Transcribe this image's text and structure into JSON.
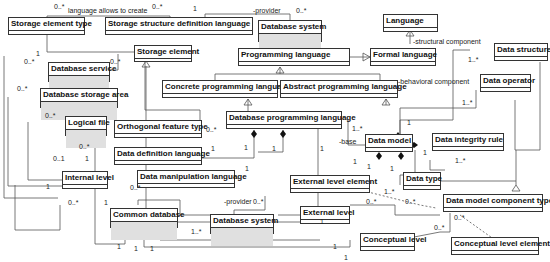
{
  "classes": {
    "storage_element_type": "Storage element type",
    "storage_structure_definition_language": "Storage structure definition language",
    "database_system_top": "Database system",
    "language": "Language",
    "storage_element": "Storage element",
    "programming_language": "Programming language",
    "formal_language": "Formal language",
    "data_structure": "Data structure",
    "database_service": "Database service",
    "database_storage_area": "Database storage area",
    "concrete_programming_language": "Concrete programming language",
    "abstract_programming_language": "Abstract programming language",
    "data_operator": "Data operator",
    "logical_file": "Logical file",
    "orthogonal_feature_type": "Orthogonal feature type",
    "database_programming_language": "Database programming language",
    "data_definition_language": "Data definition language",
    "data_model": "Data model",
    "data_integrity_rule": "Data integrity rule",
    "internal_level": "Internal level",
    "data_manipulation_language": "Data manipulation language",
    "external_level_element": "External level element",
    "data_type": "Data type",
    "common_database": "Common database",
    "database_system_bottom": "Database system",
    "external_level": "External level",
    "data_model_component_type": "Data model component type",
    "conceptual_level": "Conceptual level",
    "conceptual_level_element": "Conceptual level element"
  },
  "roles": {
    "language_allows_to_create": "language allows to create",
    "provider_top": "-provider",
    "structural_component": "-structural component",
    "behavioral_component": "-behavioral component",
    "base": "-base",
    "provider_bottom": "-provider"
  },
  "multiplicities": {
    "m1": "0..*",
    "m2": "0..*",
    "m3": "1",
    "m4": "1",
    "m5": "0..*",
    "m6": "0..*",
    "m7": "0..*",
    "m8": "0..*",
    "m9": "0..*",
    "m10": "0..1",
    "m11": "0..*",
    "m12": "1",
    "m13": "1",
    "m14": "0..*",
    "m15": "1",
    "m16": "1..*",
    "m17": "1..*",
    "m18": "0..*",
    "m19": "1",
    "m20": "1",
    "m21": "1",
    "m22": "1",
    "m23": "1..*",
    "m24": "1",
    "m25": "1",
    "m26": "1",
    "m27": "1",
    "m28": "1",
    "m29": "1..*",
    "m30": "1",
    "m31": "1..*",
    "m32": "0..*",
    "m33": "0..*",
    "m34": "0..*",
    "m35": "0..*",
    "m36": "0..*",
    "m37": "1..*",
    "m38": "1",
    "m39": "1",
    "m40": "1",
    "m41": "1",
    "m42": "1",
    "m43": "0..*",
    "m44": "1"
  }
}
